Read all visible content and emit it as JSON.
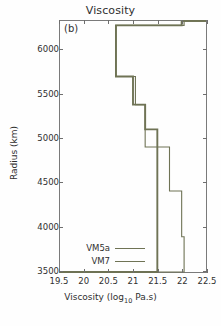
{
  "figure": {
    "title": "Viscosity",
    "panel_label": "(b)",
    "line_color": "#6f7355",
    "frame_color": "#7a7a7a",
    "background": "#fefefe"
  },
  "axes": {
    "x_title_main": "Viscosity (log",
    "x_title_sub": "10",
    "x_title_tail": " Pa.s)",
    "y_title": "Radius (km)",
    "x_ticks": [
      "19.5",
      "20",
      "20.5",
      "21",
      "21.5",
      "22",
      "22.5"
    ],
    "y_ticks": [
      "3500",
      "4000",
      "4500",
      "5000",
      "5500",
      "6000"
    ]
  },
  "legend": {
    "items": [
      {
        "label": "VM5a",
        "color": "#6f7355",
        "width": 1.9
      },
      {
        "label": "VM7",
        "color": "#6f7355",
        "width": 1.1
      }
    ]
  },
  "chart_data": {
    "type": "line",
    "title": "Viscosity",
    "panel": "(b)",
    "xlabel": "Viscosity (log10 Pa.s)",
    "ylabel": "Radius (km)",
    "xlim": [
      19.5,
      22.5
    ],
    "ylim": [
      3480,
      6330
    ],
    "grid": false,
    "legend_position": "lower-left-inside",
    "orientation": "x=viscosity, y=radius (step profile)",
    "series": [
      {
        "name": "VM5a",
        "color": "#6f7355",
        "linewidth": 1.9,
        "layers": [
          {
            "radius_top": 6330,
            "radius_bottom": 6280,
            "viscosity": 22.0
          },
          {
            "radius_top": 6280,
            "radius_bottom": 5700,
            "viscosity": 20.65
          },
          {
            "radius_top": 5700,
            "radius_bottom": 5380,
            "viscosity": 21.0
          },
          {
            "radius_top": 5380,
            "radius_bottom": 5100,
            "viscosity": 21.25
          },
          {
            "radius_top": 5100,
            "radius_bottom": 3480,
            "viscosity": 21.5
          }
        ]
      },
      {
        "name": "VM7",
        "color": "#6f7355",
        "linewidth": 1.1,
        "layers": [
          {
            "radius_top": 6330,
            "radius_bottom": 6280,
            "viscosity": 22.05
          },
          {
            "radius_top": 6280,
            "radius_bottom": 5700,
            "viscosity": 20.65
          },
          {
            "radius_top": 5700,
            "radius_bottom": 5380,
            "viscosity": 21.05
          },
          {
            "radius_top": 5380,
            "radius_bottom": 4900,
            "viscosity": 21.25
          },
          {
            "radius_top": 4900,
            "radius_bottom": 4400,
            "viscosity": 21.75
          },
          {
            "radius_top": 4400,
            "radius_bottom": 3880,
            "viscosity": 22.0
          },
          {
            "radius_top": 3880,
            "radius_bottom": 3480,
            "viscosity": 22.05
          }
        ]
      }
    ]
  }
}
